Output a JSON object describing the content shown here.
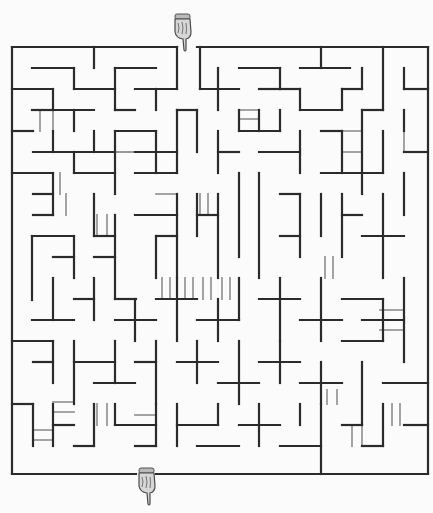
{
  "puzzle": {
    "type": "maze",
    "title": "Maze",
    "entrance_label": "Start",
    "exit_label": "Finish",
    "colors": {
      "background": "#fbfbfb",
      "wall": "#2b2b2b",
      "bridge": "#9a9a9a",
      "hand": "#7a7a7a"
    },
    "bounds": {
      "left": 12,
      "top": 47,
      "right": 428,
      "bottom": 474
    },
    "entrance": {
      "icon": "pointing-hand-down-icon",
      "x": 182,
      "y": 32
    },
    "exit": {
      "icon": "pointing-hand-down-icon",
      "x": 146,
      "y": 470
    },
    "walls": [
      [
        12,
        47,
        177,
        47
      ],
      [
        197,
        47,
        428,
        47
      ],
      [
        12,
        47,
        12,
        474
      ],
      [
        428,
        47,
        428,
        474
      ],
      [
        12,
        474,
        136,
        474
      ],
      [
        156,
        474,
        428,
        474
      ],
      [
        94,
        47,
        94,
        68
      ],
      [
        32,
        68,
        74,
        68
      ],
      [
        74,
        68,
        74,
        89
      ],
      [
        74,
        89,
        115,
        89
      ],
      [
        115,
        68,
        156,
        68
      ],
      [
        115,
        68,
        115,
        110
      ],
      [
        156,
        110,
        156,
        89
      ],
      [
        135,
        89,
        177,
        89
      ],
      [
        177,
        47,
        177,
        89
      ],
      [
        12,
        89,
        53,
        89
      ],
      [
        53,
        89,
        53,
        110
      ],
      [
        32,
        110,
        53,
        110
      ],
      [
        53,
        110,
        94,
        110
      ],
      [
        74,
        110,
        74,
        131
      ],
      [
        53,
        131,
        53,
        152
      ],
      [
        12,
        131,
        33,
        131
      ],
      [
        33,
        152,
        115,
        152
      ],
      [
        94,
        131,
        94,
        152
      ],
      [
        115,
        110,
        135,
        110
      ],
      [
        200,
        47,
        200,
        89
      ],
      [
        200,
        89,
        239,
        89
      ],
      [
        218,
        68,
        218,
        110
      ],
      [
        239,
        68,
        280,
        68
      ],
      [
        259,
        89,
        280,
        89
      ],
      [
        239,
        110,
        239,
        131
      ],
      [
        280,
        68,
        280,
        89
      ],
      [
        259,
        110,
        259,
        131
      ],
      [
        300,
        68,
        350,
        68
      ],
      [
        280,
        89,
        300,
        89
      ],
      [
        321,
        47,
        321,
        68
      ],
      [
        300,
        89,
        300,
        110
      ],
      [
        300,
        110,
        342,
        110
      ],
      [
        342,
        89,
        342,
        110
      ],
      [
        362,
        68,
        362,
        89
      ],
      [
        342,
        89,
        362,
        89
      ],
      [
        383,
        47,
        383,
        110
      ],
      [
        404,
        68,
        404,
        89
      ],
      [
        404,
        89,
        428,
        89
      ],
      [
        362,
        110,
        383,
        110
      ],
      [
        12,
        173,
        53,
        173
      ],
      [
        53,
        173,
        53,
        215
      ],
      [
        33,
        194,
        53,
        194
      ],
      [
        33,
        215,
        53,
        215
      ],
      [
        74,
        152,
        74,
        173
      ],
      [
        74,
        173,
        115,
        173
      ],
      [
        94,
        194,
        94,
        236
      ],
      [
        115,
        131,
        115,
        194
      ],
      [
        115,
        131,
        156,
        131
      ],
      [
        156,
        131,
        156,
        173
      ],
      [
        135,
        152,
        177,
        152
      ],
      [
        135,
        173,
        177,
        173
      ],
      [
        177,
        110,
        177,
        173
      ],
      [
        177,
        110,
        197,
        110
      ],
      [
        197,
        110,
        197,
        152
      ],
      [
        218,
        131,
        218,
        173
      ],
      [
        218,
        152,
        239,
        152
      ],
      [
        239,
        131,
        280,
        131
      ],
      [
        259,
        152,
        300,
        152
      ],
      [
        280,
        110,
        280,
        131
      ],
      [
        300,
        131,
        300,
        173
      ],
      [
        321,
        131,
        342,
        131
      ],
      [
        342,
        131,
        342,
        173
      ],
      [
        321,
        173,
        383,
        173
      ],
      [
        362,
        110,
        362,
        194
      ],
      [
        383,
        131,
        383,
        173
      ],
      [
        404,
        152,
        428,
        152
      ],
      [
        404,
        110,
        404,
        131
      ],
      [
        32,
        236,
        74,
        236
      ],
      [
        32,
        236,
        32,
        300
      ],
      [
        53,
        257,
        74,
        257
      ],
      [
        74,
        236,
        74,
        278
      ],
      [
        94,
        257,
        115,
        257
      ],
      [
        94,
        236,
        115,
        236
      ],
      [
        115,
        215,
        115,
        299
      ],
      [
        115,
        299,
        136,
        299
      ],
      [
        135,
        215,
        177,
        215
      ],
      [
        156,
        236,
        177,
        236
      ],
      [
        156,
        236,
        156,
        278
      ],
      [
        177,
        194,
        177,
        278
      ],
      [
        197,
        194,
        197,
        236
      ],
      [
        197,
        215,
        218,
        215
      ],
      [
        218,
        194,
        218,
        278
      ],
      [
        239,
        173,
        239,
        257
      ],
      [
        259,
        173,
        259,
        278
      ],
      [
        280,
        194,
        300,
        194
      ],
      [
        300,
        194,
        300,
        257
      ],
      [
        280,
        236,
        300,
        236
      ],
      [
        321,
        194,
        321,
        236
      ],
      [
        342,
        194,
        342,
        257
      ],
      [
        342,
        215,
        362,
        215
      ],
      [
        362,
        236,
        404,
        236
      ],
      [
        383,
        194,
        383,
        278
      ],
      [
        404,
        173,
        404,
        215
      ],
      [
        32,
        320,
        74,
        320
      ],
      [
        53,
        278,
        53,
        320
      ],
      [
        74,
        299,
        94,
        299
      ],
      [
        94,
        278,
        94,
        320
      ],
      [
        115,
        320,
        156,
        320
      ],
      [
        135,
        299,
        135,
        341
      ],
      [
        156,
        299,
        197,
        299
      ],
      [
        177,
        278,
        177,
        341
      ],
      [
        197,
        320,
        239,
        320
      ],
      [
        218,
        299,
        218,
        341
      ],
      [
        239,
        278,
        239,
        320
      ],
      [
        259,
        299,
        300,
        299
      ],
      [
        280,
        278,
        280,
        341
      ],
      [
        300,
        320,
        342,
        320
      ],
      [
        321,
        278,
        321,
        341
      ],
      [
        342,
        299,
        383,
        299
      ],
      [
        362,
        320,
        404,
        320
      ],
      [
        383,
        299,
        383,
        341
      ],
      [
        404,
        278,
        404,
        362
      ],
      [
        12,
        341,
        53,
        341
      ],
      [
        53,
        341,
        53,
        383
      ],
      [
        33,
        362,
        53,
        362
      ],
      [
        74,
        341,
        74,
        404
      ],
      [
        74,
        362,
        115,
        362
      ],
      [
        94,
        383,
        135,
        383
      ],
      [
        115,
        341,
        115,
        383
      ],
      [
        135,
        362,
        156,
        362
      ],
      [
        156,
        341,
        156,
        404
      ],
      [
        177,
        362,
        218,
        362
      ],
      [
        197,
        341,
        197,
        383
      ],
      [
        218,
        383,
        259,
        383
      ],
      [
        239,
        341,
        239,
        404
      ],
      [
        259,
        362,
        300,
        362
      ],
      [
        280,
        341,
        280,
        383
      ],
      [
        300,
        383,
        342,
        383
      ],
      [
        321,
        362,
        321,
        404
      ],
      [
        342,
        341,
        383,
        341
      ],
      [
        362,
        362,
        362,
        425
      ],
      [
        383,
        383,
        428,
        383
      ],
      [
        12,
        404,
        33,
        404
      ],
      [
        33,
        404,
        33,
        446
      ],
      [
        53,
        425,
        74,
        425
      ],
      [
        53,
        404,
        53,
        446
      ],
      [
        94,
        404,
        94,
        446
      ],
      [
        74,
        446,
        94,
        446
      ],
      [
        115,
        404,
        115,
        425
      ],
      [
        115,
        425,
        156,
        425
      ],
      [
        135,
        446,
        156,
        446
      ],
      [
        156,
        404,
        156,
        446
      ],
      [
        177,
        404,
        177,
        446
      ],
      [
        177,
        425,
        218,
        425
      ],
      [
        197,
        446,
        239,
        446
      ],
      [
        218,
        404,
        218,
        425
      ],
      [
        239,
        425,
        280,
        425
      ],
      [
        259,
        404,
        259,
        446
      ],
      [
        280,
        446,
        321,
        446
      ],
      [
        300,
        404,
        300,
        425
      ],
      [
        321,
        404,
        321,
        474
      ],
      [
        342,
        425,
        362,
        425
      ],
      [
        362,
        446,
        383,
        446
      ],
      [
        383,
        404,
        383,
        446
      ],
      [
        404,
        425,
        428,
        425
      ]
    ],
    "bridges": [
      [
        40,
        110,
        40,
        131
      ],
      [
        53,
        110,
        53,
        131
      ],
      [
        115,
        152,
        156,
        152
      ],
      [
        177,
        131,
        177,
        152
      ],
      [
        239,
        110,
        259,
        110
      ],
      [
        239,
        119,
        259,
        119
      ],
      [
        342,
        131,
        362,
        131
      ],
      [
        342,
        152,
        362,
        152
      ],
      [
        383,
        131,
        383,
        152
      ],
      [
        404,
        131,
        404,
        152
      ],
      [
        60,
        173,
        60,
        194
      ],
      [
        66,
        194,
        66,
        215
      ],
      [
        97,
        215,
        97,
        236
      ],
      [
        107,
        215,
        107,
        236
      ],
      [
        156,
        173,
        177,
        173
      ],
      [
        156,
        194,
        177,
        194
      ],
      [
        200,
        194,
        200,
        215
      ],
      [
        208,
        194,
        208,
        215
      ],
      [
        325,
        257,
        325,
        278
      ],
      [
        333,
        257,
        333,
        278
      ],
      [
        162,
        278,
        162,
        299
      ],
      [
        170,
        278,
        170,
        299
      ],
      [
        185,
        278,
        185,
        299
      ],
      [
        193,
        278,
        193,
        299
      ],
      [
        203,
        278,
        203,
        299
      ],
      [
        211,
        278,
        211,
        299
      ],
      [
        222,
        278,
        222,
        299
      ],
      [
        230,
        278,
        230,
        299
      ],
      [
        380,
        310,
        404,
        310
      ],
      [
        380,
        330,
        404,
        330
      ],
      [
        53,
        402,
        74,
        402
      ],
      [
        53,
        412,
        74,
        412
      ],
      [
        33,
        430,
        53,
        430
      ],
      [
        33,
        440,
        53,
        440
      ],
      [
        97,
        404,
        97,
        425
      ],
      [
        107,
        404,
        107,
        425
      ],
      [
        135,
        415,
        156,
        415
      ],
      [
        135,
        425,
        156,
        425
      ],
      [
        327,
        390,
        327,
        404
      ],
      [
        337,
        390,
        337,
        404
      ],
      [
        352,
        425,
        352,
        446
      ],
      [
        362,
        425,
        362,
        446
      ],
      [
        392,
        404,
        392,
        425
      ],
      [
        400,
        404,
        400,
        425
      ]
    ]
  }
}
